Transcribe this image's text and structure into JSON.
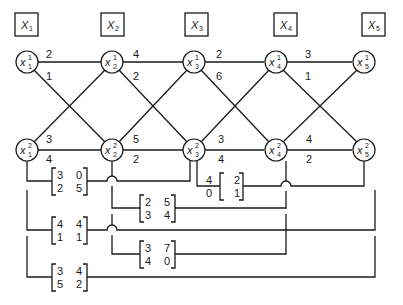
{
  "headers": [
    "X",
    "X",
    "X",
    "X",
    "X"
  ],
  "header_subs": [
    "1",
    "2",
    "3",
    "4",
    "5"
  ],
  "nodes_row1": {
    "base": "x",
    "sup": "1",
    "subs": [
      "1",
      "2",
      "3",
      "4",
      "5"
    ]
  },
  "nodes_row2": {
    "base": "x",
    "sup": "2",
    "subs": [
      "1",
      "2",
      "3",
      "4",
      "5"
    ]
  },
  "edges": {
    "top_horizontal": [
      "2",
      "4",
      "2",
      "3"
    ],
    "top_diagonal": [
      "1",
      "2",
      "6",
      "1"
    ],
    "bottom_diagonal": [
      "3",
      "5",
      "3",
      "4"
    ],
    "bottom_horizontal": [
      "4",
      "2",
      "4",
      "2"
    ]
  },
  "matrices": [
    {
      "id": "m13",
      "from": "x1",
      "to": "x3",
      "values": [
        [
          "3",
          "0"
        ],
        [
          "2",
          "5"
        ]
      ]
    },
    {
      "id": "m35",
      "from": "x3",
      "to": "x5",
      "values": [
        [
          "4",
          "2"
        ],
        [
          "0",
          "1"
        ]
      ]
    },
    {
      "id": "m24",
      "from": "x2",
      "to": "x4",
      "values": [
        [
          "2",
          "5"
        ],
        [
          "3",
          "4"
        ]
      ]
    },
    {
      "id": "m15a",
      "from": "x1",
      "to": "x5",
      "values": [
        [
          "4",
          "4"
        ],
        [
          "1",
          "1"
        ]
      ]
    },
    {
      "id": "m24b",
      "from": "x2",
      "to": "x4",
      "values": [
        [
          "3",
          "7"
        ],
        [
          "4",
          "0"
        ]
      ]
    },
    {
      "id": "m15b",
      "from": "x1",
      "to": "x5",
      "values": [
        [
          "3",
          "4"
        ],
        [
          "5",
          "2"
        ]
      ]
    }
  ]
}
